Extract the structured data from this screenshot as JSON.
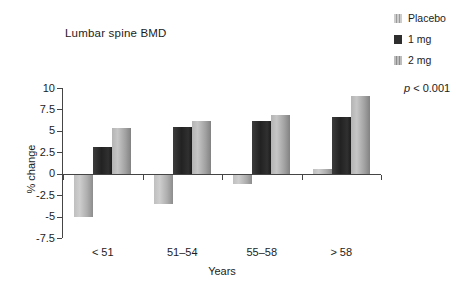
{
  "title": "Lumbar spine BMD",
  "legend": {
    "items": [
      {
        "label": "Placebo"
      },
      {
        "label": "1 mg"
      },
      {
        "label": "2 mg"
      }
    ]
  },
  "annotation": {
    "italic": "p",
    "text": " < 0.001"
  },
  "chart_data": {
    "type": "bar",
    "title": "Lumbar spine BMD",
    "categories": [
      "< 51",
      "51–54",
      "55–58",
      "> 58"
    ],
    "series": [
      {
        "name": "Placebo",
        "values": [
          -5.1,
          -3.5,
          -1.2,
          0.5
        ]
      },
      {
        "name": "1 mg",
        "values": [
          3.1,
          5.4,
          6.2,
          6.6
        ]
      },
      {
        "name": "2 mg",
        "values": [
          5.3,
          6.2,
          6.8,
          9.1
        ]
      }
    ],
    "xlabel": "Years",
    "ylabel": "% change",
    "ylim": [
      -7.5,
      10
    ],
    "yticks": [
      10,
      7.5,
      5,
      2.5,
      0,
      -2.5,
      -5,
      -7.5
    ],
    "annotation": "p < 0.001",
    "legend_position": "top-right",
    "grid": false,
    "colors": {
      "placebo": "#b5b5b5",
      "one_mg": "#2b2b2b",
      "two_mg": "#a3a3a3"
    }
  }
}
